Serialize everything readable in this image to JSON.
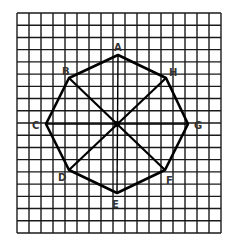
{
  "figure": {
    "type": "octagon-on-grid",
    "grid": {
      "columns": 17,
      "rows": 18,
      "x0": 17,
      "y0": 13,
      "x1": 221,
      "y1": 233
    },
    "center": {
      "x": 117,
      "y": 124
    },
    "vertices": [
      {
        "id": "A",
        "x": 118,
        "y": 55,
        "label": "A",
        "lx": 114,
        "ly": 51
      },
      {
        "id": "H",
        "x": 166,
        "y": 78,
        "label": "H",
        "lx": 169,
        "ly": 76
      },
      {
        "id": "G",
        "x": 188,
        "y": 124,
        "label": "G",
        "lx": 194,
        "ly": 129
      },
      {
        "id": "F",
        "x": 165,
        "y": 170,
        "label": "F",
        "lx": 166,
        "ly": 184
      },
      {
        "id": "E",
        "x": 117,
        "y": 193,
        "label": "E",
        "lx": 112,
        "ly": 208
      },
      {
        "id": "D",
        "x": 69,
        "y": 170,
        "label": "D",
        "lx": 58,
        "ly": 181
      },
      {
        "id": "C",
        "x": 46,
        "y": 124,
        "label": "C",
        "lx": 32,
        "ly": 129
      },
      {
        "id": "B",
        "x": 69,
        "y": 78,
        "label": "B",
        "lx": 62,
        "ly": 75
      }
    ],
    "diagonals": [
      [
        "B",
        "F"
      ],
      [
        "H",
        "D"
      ]
    ],
    "axes": [
      [
        "A",
        "E"
      ],
      [
        "C",
        "G"
      ]
    ],
    "colors": {
      "line": "#000000",
      "grid": "#1a1a1a",
      "label": "#333333",
      "background": "#ffffff"
    }
  }
}
